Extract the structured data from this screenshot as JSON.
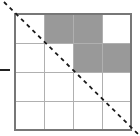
{
  "figure": {
    "title": "",
    "width": 140,
    "height": 136,
    "background_color": "#ffffff"
  },
  "grid": {
    "rows": 4,
    "cols": 4,
    "left": 15,
    "top": 14,
    "cell_size": 29,
    "border_color": "#777777",
    "gridline_color": "#b0b0b0",
    "shade_color": "#999999",
    "empty_color": "#ffffff",
    "shaded_cells": [
      {
        "row": 1,
        "col": 2
      },
      {
        "row": 1,
        "col": 3
      },
      {
        "row": 2,
        "col": 3
      },
      {
        "row": 2,
        "col": 4
      }
    ],
    "cells": [
      [
        {
          "row": 1,
          "col": 1,
          "state": "empty"
        },
        {
          "row": 1,
          "col": 2,
          "state": "shaded"
        },
        {
          "row": 1,
          "col": 3,
          "state": "shaded"
        },
        {
          "row": 1,
          "col": 4,
          "state": "empty"
        }
      ],
      [
        {
          "row": 2,
          "col": 1,
          "state": "empty"
        },
        {
          "row": 2,
          "col": 2,
          "state": "empty"
        },
        {
          "row": 2,
          "col": 3,
          "state": "shaded"
        },
        {
          "row": 2,
          "col": 4,
          "state": "shaded"
        }
      ],
      [
        {
          "row": 3,
          "col": 1,
          "state": "empty"
        },
        {
          "row": 3,
          "col": 2,
          "state": "empty"
        },
        {
          "row": 3,
          "col": 3,
          "state": "empty"
        },
        {
          "row": 3,
          "col": 4,
          "state": "empty"
        }
      ],
      [
        {
          "row": 4,
          "col": 1,
          "state": "empty"
        },
        {
          "row": 4,
          "col": 2,
          "state": "empty"
        },
        {
          "row": 4,
          "col": 3,
          "state": "empty"
        },
        {
          "row": 4,
          "col": 4,
          "state": "empty"
        }
      ]
    ]
  },
  "diagonal": {
    "name": "dashed-diagonal-line",
    "color": "#1a1a1a",
    "stroke_width": 1.8,
    "dash_pattern": "4 4",
    "x1": 4,
    "y1": 2,
    "x2": 139,
    "y2": 135
  },
  "tick": {
    "name": "left-axis-tick",
    "color": "#222222",
    "x1": 0,
    "y1": 70,
    "x2": 10,
    "y2": 70,
    "stroke_width": 1.6
  }
}
